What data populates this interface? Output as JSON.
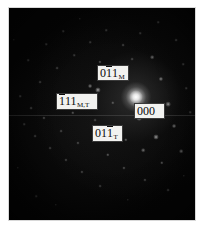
{
  "figure": {
    "type": "electron-diffraction-pattern",
    "technique": "selected-area electron diffraction (SAED)",
    "background_color": "#050505",
    "page_color": "#ffffff",
    "label_box_fill": "#f2f2f0",
    "label_box_border": "#3a3a3a",
    "label_text_color": "#0a0a0a",
    "plate": {
      "x": 9,
      "y": 8,
      "width": 186,
      "height": 212
    },
    "seam_y": 115
  },
  "labels": [
    {
      "id": "label-011-M",
      "name": "011_M",
      "digits": [
        {
          "char": "0",
          "overbar": false
        },
        {
          "char": "1",
          "overbar": true
        },
        {
          "char": "1",
          "overbar": false
        }
      ],
      "plain": "011",
      "subscript": "M",
      "phase": "Martensite",
      "box": {
        "x": 97,
        "y": 65,
        "width": 32,
        "height": 16
      }
    },
    {
      "id": "label-111-MT",
      "name": "111_M,T",
      "digits": [
        {
          "char": "1",
          "overbar": true
        },
        {
          "char": "1",
          "overbar": false
        },
        {
          "char": "1",
          "overbar": false
        }
      ],
      "plain": "111",
      "subscript": "M,T",
      "phase": "Martensite / Twin",
      "box": {
        "x": 56,
        "y": 93,
        "width": 42,
        "height": 17
      }
    },
    {
      "id": "label-000",
      "name": "000",
      "digits": [
        {
          "char": "0",
          "overbar": false
        },
        {
          "char": "0",
          "overbar": false
        },
        {
          "char": "0",
          "overbar": false
        }
      ],
      "plain": "000",
      "subscript": "",
      "phase": "Transmitted beam",
      "box": {
        "x": 134,
        "y": 103,
        "width": 31,
        "height": 16
      }
    },
    {
      "id": "label-011-T",
      "name": "011_T",
      "digits": [
        {
          "char": "0",
          "overbar": false
        },
        {
          "char": "1",
          "overbar": false
        },
        {
          "char": "1",
          "overbar": true
        }
      ],
      "plain": "011",
      "subscript": "T",
      "phase": "Twin",
      "box": {
        "x": 92,
        "y": 125,
        "width": 31,
        "height": 17
      }
    }
  ],
  "central_beam": {
    "x": 136,
    "y": 97,
    "size": 30
  },
  "spots": [
    {
      "x": 136,
      "y": 97,
      "r": 5.0,
      "i": 1.0
    },
    {
      "x": 120,
      "y": 72,
      "r": 2.2,
      "i": 0.72
    },
    {
      "x": 98,
      "y": 90,
      "r": 2.0,
      "i": 0.62
    },
    {
      "x": 90,
      "y": 86,
      "r": 1.5,
      "i": 0.48
    },
    {
      "x": 168,
      "y": 104,
      "r": 1.8,
      "i": 0.55
    },
    {
      "x": 161,
      "y": 79,
      "r": 1.6,
      "i": 0.5
    },
    {
      "x": 152,
      "y": 57,
      "r": 1.4,
      "i": 0.44
    },
    {
      "x": 139,
      "y": 118,
      "r": 1.8,
      "i": 0.58
    },
    {
      "x": 156,
      "y": 137,
      "r": 1.9,
      "i": 0.6
    },
    {
      "x": 174,
      "y": 126,
      "r": 1.5,
      "i": 0.46
    },
    {
      "x": 181,
      "y": 151,
      "r": 1.4,
      "i": 0.42
    },
    {
      "x": 162,
      "y": 163,
      "r": 1.3,
      "i": 0.4
    },
    {
      "x": 143,
      "y": 150,
      "r": 1.4,
      "i": 0.44
    },
    {
      "x": 126,
      "y": 140,
      "r": 1.3,
      "i": 0.38
    },
    {
      "x": 113,
      "y": 128,
      "r": 1.2,
      "i": 0.34
    },
    {
      "x": 108,
      "y": 155,
      "r": 1.3,
      "i": 0.38
    },
    {
      "x": 124,
      "y": 168,
      "r": 1.2,
      "i": 0.35
    },
    {
      "x": 145,
      "y": 180,
      "r": 1.2,
      "i": 0.34
    },
    {
      "x": 168,
      "y": 190,
      "r": 1.1,
      "i": 0.3
    },
    {
      "x": 100,
      "y": 186,
      "r": 1.1,
      "i": 0.3
    },
    {
      "x": 82,
      "y": 172,
      "r": 1.2,
      "i": 0.33
    },
    {
      "x": 66,
      "y": 160,
      "r": 1.2,
      "i": 0.33
    },
    {
      "x": 50,
      "y": 148,
      "r": 1.1,
      "i": 0.3
    },
    {
      "x": 35,
      "y": 136,
      "r": 1.1,
      "i": 0.3
    },
    {
      "x": 24,
      "y": 124,
      "r": 1.0,
      "i": 0.26
    },
    {
      "x": 44,
      "y": 118,
      "r": 1.2,
      "i": 0.34
    },
    {
      "x": 61,
      "y": 131,
      "r": 1.1,
      "i": 0.3
    },
    {
      "x": 78,
      "y": 143,
      "r": 1.2,
      "i": 0.33
    },
    {
      "x": 95,
      "y": 120,
      "r": 1.1,
      "i": 0.3
    },
    {
      "x": 73,
      "y": 113,
      "r": 1.3,
      "i": 0.36
    },
    {
      "x": 31,
      "y": 108,
      "r": 1.1,
      "i": 0.3
    },
    {
      "x": 20,
      "y": 96,
      "r": 1.0,
      "i": 0.26
    },
    {
      "x": 40,
      "y": 82,
      "r": 1.1,
      "i": 0.3
    },
    {
      "x": 57,
      "y": 68,
      "r": 1.1,
      "i": 0.3
    },
    {
      "x": 74,
      "y": 55,
      "r": 1.0,
      "i": 0.26
    },
    {
      "x": 90,
      "y": 42,
      "r": 1.0,
      "i": 0.26
    },
    {
      "x": 106,
      "y": 30,
      "r": 1.0,
      "i": 0.26
    },
    {
      "x": 123,
      "y": 45,
      "r": 1.1,
      "i": 0.3
    },
    {
      "x": 140,
      "y": 33,
      "r": 1.0,
      "i": 0.26
    },
    {
      "x": 158,
      "y": 22,
      "r": 1.0,
      "i": 0.26
    },
    {
      "x": 176,
      "y": 40,
      "r": 1.1,
      "i": 0.3
    },
    {
      "x": 183,
      "y": 64,
      "r": 1.0,
      "i": 0.26
    },
    {
      "x": 28,
      "y": 60,
      "r": 1.0,
      "i": 0.24
    },
    {
      "x": 46,
      "y": 44,
      "r": 1.0,
      "i": 0.24
    },
    {
      "x": 63,
      "y": 31,
      "r": 1.0,
      "i": 0.24
    },
    {
      "x": 80,
      "y": 19,
      "r": 0.9,
      "i": 0.22
    },
    {
      "x": 113,
      "y": 103,
      "r": 1.3,
      "i": 0.36
    },
    {
      "x": 152,
      "y": 112,
      "r": 1.2,
      "i": 0.33
    },
    {
      "x": 186,
      "y": 88,
      "r": 1.0,
      "i": 0.26
    },
    {
      "x": 190,
      "y": 112,
      "r": 1.0,
      "i": 0.26
    },
    {
      "x": 36,
      "y": 196,
      "r": 1.0,
      "i": 0.24
    },
    {
      "x": 56,
      "y": 205,
      "r": 0.9,
      "i": 0.22
    },
    {
      "x": 128,
      "y": 200,
      "r": 0.9,
      "i": 0.22
    },
    {
      "x": 184,
      "y": 176,
      "r": 0.9,
      "i": 0.22
    },
    {
      "x": 18,
      "y": 168,
      "r": 0.9,
      "i": 0.22
    },
    {
      "x": 14,
      "y": 40,
      "r": 0.9,
      "i": 0.2
    },
    {
      "x": 100,
      "y": 62,
      "r": 1.2,
      "i": 0.34
    },
    {
      "x": 132,
      "y": 59,
      "r": 1.1,
      "i": 0.3
    }
  ]
}
